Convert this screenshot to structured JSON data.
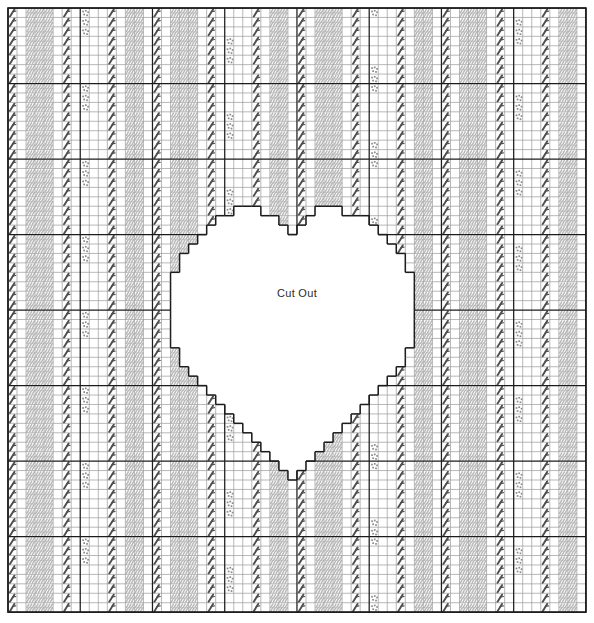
{
  "chart_data": {
    "type": "heatmap",
    "title": "",
    "grid": {
      "cols": 64,
      "rows": 64,
      "origin_x": 8,
      "origin_y": 8,
      "cell_w": 9.03,
      "cell_h": 9.44,
      "heavy_every": 8,
      "grid_on": true
    },
    "colors": {
      "background": "#ffffff",
      "light_grid": "#9a9a9a",
      "heavy_grid": "#1c1c1c",
      "border": "#1c1c1c",
      "symbol_dark": "#4e4e4e",
      "symbol_gray": "#b9b9b9",
      "symbol_dot": "#8a8a8a",
      "cutout_fill": "#ffffff",
      "cutout_outline": "#1c1c1c",
      "label_text": "#2b2b2b"
    },
    "symbols": [
      {
        "key": "slash",
        "name": "dark-diagonal-slash",
        "color": "#4e4e4e"
      },
      {
        "key": "mesh",
        "name": "gray-textured-block",
        "color": "#b9b9b9"
      },
      {
        "key": "dots",
        "name": "scattered-dot-cluster",
        "color": "#8a8a8a"
      },
      {
        "key": "blank",
        "name": "empty-cell",
        "color": "#ffffff"
      }
    ],
    "column_motif_period": 16,
    "column_motif": [
      "slash",
      "blank",
      "mesh",
      "mesh",
      "mesh",
      "blank",
      "slash",
      "blank",
      "dots",
      "blank",
      "blank",
      "slash",
      "blank",
      "mesh",
      "mesh",
      "blank"
    ],
    "dot_cluster_period_rows": 16,
    "xlabel": "",
    "ylabel": "",
    "legend": []
  },
  "cutout": {
    "label": "Cut Out",
    "shape": "heart",
    "label_x": 297,
    "label_y": 294
  }
}
